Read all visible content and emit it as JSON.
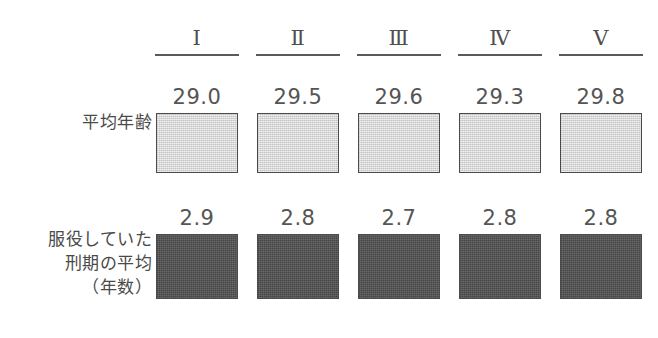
{
  "chart_data": {
    "type": "bar",
    "title": "",
    "xlabel": "",
    "ylabel": "",
    "grid": false,
    "legend": "none",
    "categories": [
      "Ⅰ",
      "Ⅱ",
      "Ⅲ",
      "Ⅳ",
      "Ⅴ"
    ],
    "series": [
      {
        "name": "平均年齢",
        "values": [
          29.0,
          29.5,
          29.6,
          29.3,
          29.8
        ],
        "value_labels": [
          "29.0",
          "29.5",
          "29.6",
          "29.3",
          "29.8"
        ],
        "color": "#d7d7d7",
        "border_color": "#4b4b4b"
      },
      {
        "name": "服役していた\n刑期の平均\n（年数）",
        "values": [
          2.9,
          2.8,
          2.7,
          2.8,
          2.8
        ],
        "value_labels": [
          "2.9",
          "2.8",
          "2.7",
          "2.8",
          "2.8"
        ],
        "color": "#565656",
        "border_color": "#4b4b4b"
      }
    ]
  },
  "header": {
    "columns": [
      {
        "label": "Ⅰ"
      },
      {
        "label": "Ⅱ"
      },
      {
        "label": "Ⅲ"
      },
      {
        "label": "Ⅳ"
      },
      {
        "label": "Ⅴ"
      }
    ]
  },
  "rows": {
    "age": {
      "label": "平均年齢",
      "values": [
        "29.0",
        "29.5",
        "29.6",
        "29.3",
        "29.8"
      ]
    },
    "term": {
      "label": "服役していた\n刑期の平均\n（年数）",
      "values": [
        "2.9",
        "2.8",
        "2.7",
        "2.8",
        "2.8"
      ]
    }
  }
}
